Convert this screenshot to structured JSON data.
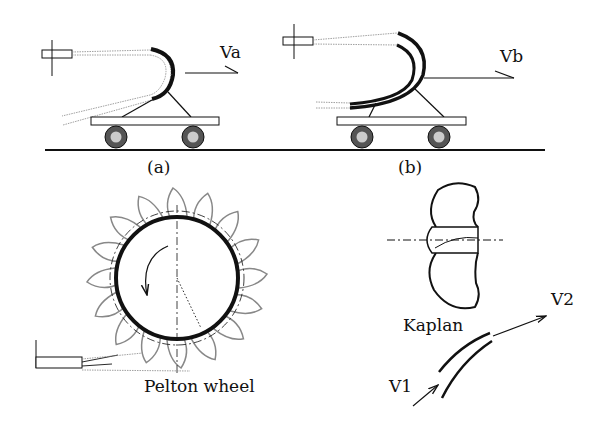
{
  "diagram": {
    "type": "turbine-principles",
    "panels": {
      "a": {
        "caption": "(a)",
        "velocity_label": "Va",
        "description": "jet deflected by single curved vane on a cart"
      },
      "b": {
        "caption": "(b)",
        "velocity_label": "Vb",
        "description": "jet deflected by double curved vane on a cart"
      },
      "pelton": {
        "caption": "Pelton wheel",
        "bucket_count": 16
      },
      "kaplan": {
        "caption": "Kaplan"
      },
      "blade": {
        "inlet_label": "V1",
        "outlet_label": "V2"
      }
    },
    "colors": {
      "ink": "#111111",
      "spray": "#999999",
      "wheel_fill": "#bbbbbb",
      "tyre": "#666666",
      "background": "#ffffff"
    }
  }
}
